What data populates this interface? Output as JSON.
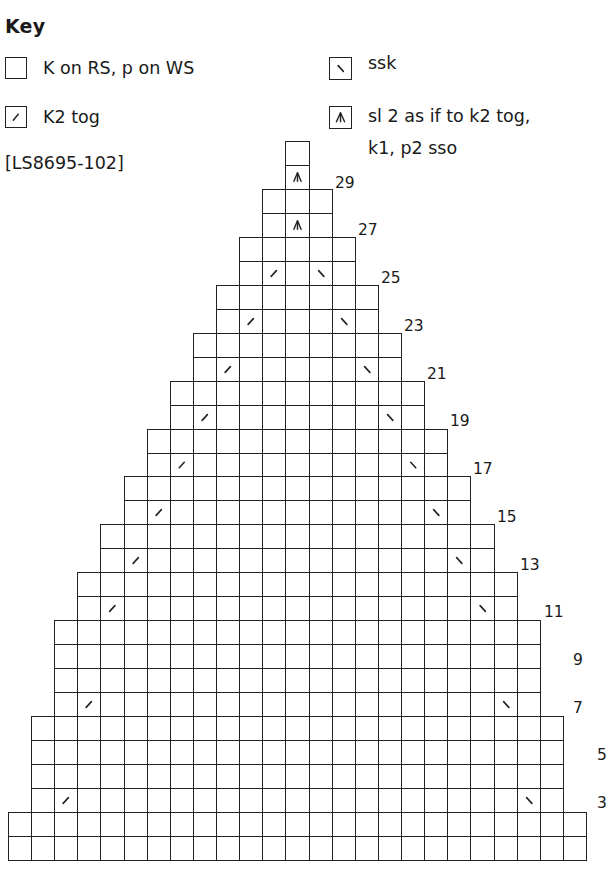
{
  "key": {
    "title": "Key",
    "items": [
      {
        "symbol": "knit",
        "label": "K on RS, p on WS",
        "icon": "empty-square-icon"
      },
      {
        "symbol": "k2tog",
        "label": "K2 tog",
        "icon": "right-slant-slash-icon"
      },
      {
        "symbol": "ssk",
        "label": "ssk",
        "icon": "left-slant-slash-icon"
      },
      {
        "symbol": "cdd",
        "label_line1": "sl 2 as if to k2 tog,",
        "label_line2": "k1, p2 sso",
        "icon": "centered-double-decrease-icon"
      }
    ],
    "code": "[LS8695-102]"
  },
  "chart_data": {
    "type": "table",
    "total_columns": 25,
    "total_rows": 30,
    "row_numbering": "bottom-to-top, odd (RS) rows labeled on right",
    "rows": [
      {
        "row": 1,
        "start_col": 0,
        "cells": 25,
        "marks": []
      },
      {
        "row": 2,
        "start_col": 0,
        "cells": 25,
        "marks": []
      },
      {
        "row": 3,
        "start_col": 1,
        "cells": 23,
        "marks": [
          {
            "col": 2,
            "type": "k2tog"
          },
          {
            "col": 22,
            "type": "ssk"
          }
        ]
      },
      {
        "row": 4,
        "start_col": 1,
        "cells": 23,
        "marks": []
      },
      {
        "row": 5,
        "start_col": 1,
        "cells": 23,
        "marks": []
      },
      {
        "row": 6,
        "start_col": 1,
        "cells": 23,
        "marks": []
      },
      {
        "row": 7,
        "start_col": 2,
        "cells": 21,
        "marks": [
          {
            "col": 3,
            "type": "k2tog"
          },
          {
            "col": 21,
            "type": "ssk"
          }
        ]
      },
      {
        "row": 8,
        "start_col": 2,
        "cells": 21,
        "marks": []
      },
      {
        "row": 9,
        "start_col": 2,
        "cells": 21,
        "marks": []
      },
      {
        "row": 10,
        "start_col": 2,
        "cells": 21,
        "marks": []
      },
      {
        "row": 11,
        "start_col": 3,
        "cells": 19,
        "marks": [
          {
            "col": 4,
            "type": "k2tog"
          },
          {
            "col": 20,
            "type": "ssk"
          }
        ]
      },
      {
        "row": 12,
        "start_col": 3,
        "cells": 19,
        "marks": []
      },
      {
        "row": 13,
        "start_col": 4,
        "cells": 17,
        "marks": [
          {
            "col": 5,
            "type": "k2tog"
          },
          {
            "col": 19,
            "type": "ssk"
          }
        ]
      },
      {
        "row": 14,
        "start_col": 4,
        "cells": 17,
        "marks": []
      },
      {
        "row": 15,
        "start_col": 5,
        "cells": 15,
        "marks": [
          {
            "col": 6,
            "type": "k2tog"
          },
          {
            "col": 18,
            "type": "ssk"
          }
        ]
      },
      {
        "row": 16,
        "start_col": 5,
        "cells": 15,
        "marks": []
      },
      {
        "row": 17,
        "start_col": 6,
        "cells": 13,
        "marks": [
          {
            "col": 7,
            "type": "k2tog"
          },
          {
            "col": 17,
            "type": "ssk"
          }
        ]
      },
      {
        "row": 18,
        "start_col": 6,
        "cells": 13,
        "marks": []
      },
      {
        "row": 19,
        "start_col": 7,
        "cells": 11,
        "marks": [
          {
            "col": 8,
            "type": "k2tog"
          },
          {
            "col": 16,
            "type": "ssk"
          }
        ]
      },
      {
        "row": 20,
        "start_col": 7,
        "cells": 11,
        "marks": []
      },
      {
        "row": 21,
        "start_col": 8,
        "cells": 9,
        "marks": [
          {
            "col": 9,
            "type": "k2tog"
          },
          {
            "col": 15,
            "type": "ssk"
          }
        ]
      },
      {
        "row": 22,
        "start_col": 8,
        "cells": 9,
        "marks": []
      },
      {
        "row": 23,
        "start_col": 9,
        "cells": 7,
        "marks": [
          {
            "col": 10,
            "type": "k2tog"
          },
          {
            "col": 14,
            "type": "ssk"
          }
        ]
      },
      {
        "row": 24,
        "start_col": 9,
        "cells": 7,
        "marks": []
      },
      {
        "row": 25,
        "start_col": 10,
        "cells": 5,
        "marks": [
          {
            "col": 11,
            "type": "k2tog"
          },
          {
            "col": 13,
            "type": "ssk"
          }
        ]
      },
      {
        "row": 26,
        "start_col": 10,
        "cells": 5,
        "marks": []
      },
      {
        "row": 27,
        "start_col": 11,
        "cells": 3,
        "marks": [
          {
            "col": 12,
            "type": "cdd"
          }
        ]
      },
      {
        "row": 28,
        "start_col": 11,
        "cells": 3,
        "marks": []
      },
      {
        "row": 29,
        "start_col": 12,
        "cells": 1,
        "marks": [
          {
            "col": 12,
            "type": "cdd"
          }
        ]
      },
      {
        "row": 30,
        "start_col": 12,
        "cells": 1,
        "marks": []
      }
    ],
    "row_labels": [
      {
        "row": 3,
        "text": "3",
        "x": 597,
        "y": 794
      },
      {
        "row": 5,
        "text": "5",
        "x": 597,
        "y": 746
      },
      {
        "row": 7,
        "text": "7",
        "x": 573,
        "y": 699
      },
      {
        "row": 9,
        "text": "9",
        "x": 573,
        "y": 651
      },
      {
        "row": 11,
        "text": "11",
        "x": 544,
        "y": 603
      },
      {
        "row": 13,
        "text": "13",
        "x": 520,
        "y": 556
      },
      {
        "row": 15,
        "text": "15",
        "x": 497,
        "y": 508
      },
      {
        "row": 17,
        "text": "17",
        "x": 473,
        "y": 460
      },
      {
        "row": 19,
        "text": "19",
        "x": 450,
        "y": 412
      },
      {
        "row": 21,
        "text": "21",
        "x": 427,
        "y": 365
      },
      {
        "row": 23,
        "text": "23",
        "x": 404,
        "y": 317
      },
      {
        "row": 25,
        "text": "25",
        "x": 381,
        "y": 269
      },
      {
        "row": 27,
        "text": "27",
        "x": 358,
        "y": 221
      },
      {
        "row": 29,
        "text": "29",
        "x": 335,
        "y": 174
      }
    ],
    "geometry": {
      "left": 8,
      "bottom": 860,
      "cell_w": 23.12,
      "cell_h": 23.97
    },
    "colors": {
      "grid": "#222222",
      "background": "#ffffff",
      "text": "#1a1a1a"
    }
  }
}
